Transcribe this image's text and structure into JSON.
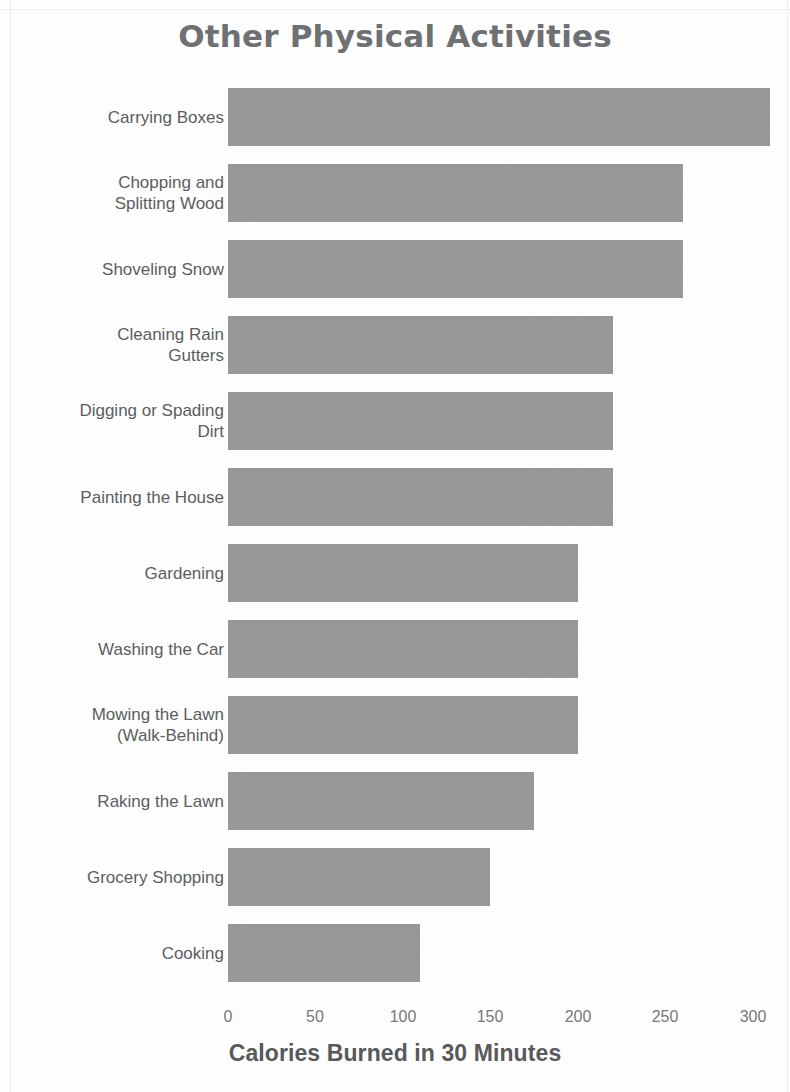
{
  "chart_data": {
    "type": "bar",
    "orientation": "horizontal",
    "title": "Other Physical Activities",
    "xlabel": "Calories Burned in 30 Minutes",
    "ylabel": "",
    "xlim": [
      0,
      315
    ],
    "xticks": [
      0,
      50,
      100,
      150,
      200,
      250,
      300
    ],
    "xtick_labels": [
      "0",
      "50",
      "100",
      "150",
      "200",
      "250",
      "300"
    ],
    "grid": false,
    "legend": null,
    "bar_color": "#9a9a9a",
    "text_color": "#5c5d5f",
    "background_color": "#fdfdfd",
    "categories": [
      "Carrying Boxes",
      "Chopping and\nSplitting Wood",
      "Shoveling Snow",
      "Cleaning Rain\nGutters",
      "Digging or Spading\nDirt",
      "Painting the House",
      "Gardening",
      "Washing the Car",
      "Mowing the Lawn\n(Walk-Behind)",
      "Raking the Lawn",
      "Grocery Shopping",
      "Cooking"
    ],
    "values": [
      310,
      260,
      260,
      220,
      220,
      220,
      200,
      200,
      200,
      175,
      150,
      110
    ]
  }
}
